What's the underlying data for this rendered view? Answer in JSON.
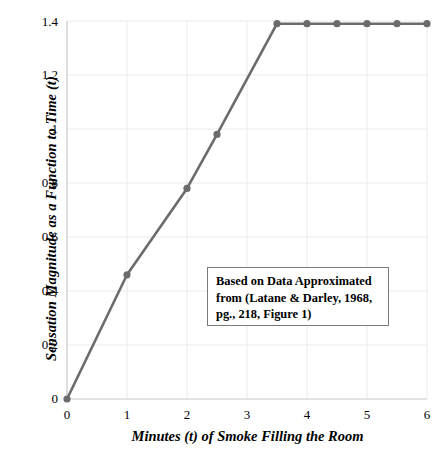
{
  "chart_data": {
    "type": "line",
    "title": "",
    "xlabel": "Minutes (t) of Smoke Filling the Room",
    "ylabel": "Sensation Magnitude as a Function to Time (t)",
    "xlim": [
      0,
      6
    ],
    "ylim": [
      0,
      1.4
    ],
    "grid": true,
    "legend": "none",
    "xticks": [
      "0",
      "1",
      "2",
      "3",
      "4",
      "5",
      "6"
    ],
    "xtick_values": [
      0,
      1,
      2,
      3,
      4,
      5,
      6
    ],
    "yticks": [
      "0",
      "0.2",
      "0.4",
      "0.6",
      "0.8",
      "1",
      "1.2",
      "1.4"
    ],
    "ytick_values": [
      0,
      0.2,
      0.4,
      0.6,
      0.8,
      1,
      1.2,
      1.4
    ],
    "series": [
      {
        "name": "Sensation Magnitude",
        "color": "#6b6b6b",
        "marker": "circle",
        "x": [
          0,
          1,
          2,
          2.5,
          3.5,
          4,
          4.5,
          5,
          5.5,
          6
        ],
        "y": [
          0.0,
          0.46,
          0.78,
          0.98,
          1.39,
          1.39,
          1.39,
          1.39,
          1.39,
          1.39
        ]
      }
    ],
    "annotations": [
      {
        "id": "source-note",
        "text": "Based on Data Approximated from (Latane & Darley, 1968, pg., 218, Figure 1)",
        "lines": [
          "Based on Data Approximated",
          "from (Latane & Darley, 1968,",
          "pg., 218, Figure 1)"
        ]
      }
    ]
  },
  "colors": {
    "series_line": "#6b6b6b",
    "grid": "#eaeaea",
    "axis": "#c8c8c8",
    "annotation_border": "#7a7a7a",
    "text": "#000000",
    "background": "#ffffff"
  }
}
